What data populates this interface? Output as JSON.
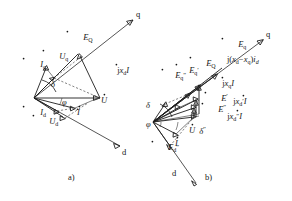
{
  "figure": {
    "type": "phasor-diagram-pair",
    "background_color": "#ffffff",
    "ink_color": "#1a1a1a"
  },
  "panel_a": {
    "caption": "a)",
    "axes": [
      {
        "name": "q-axis",
        "label": "q"
      },
      {
        "name": "d-axis",
        "label": "d"
      }
    ],
    "labels": {
      "eq": "E",
      "eq_sub": "Q",
      "uq": "U",
      "uq_sub": "q",
      "iq": "I",
      "iq_sub": "q",
      "id": "I",
      "id_sub": "d",
      "ud": "U",
      "ud_sub": "d",
      "u": "U",
      "i": "I",
      "jxdi_j": "j",
      "jxdi_x": "x",
      "jxdi_sub": "d",
      "jxdi_i": "I",
      "delta": "δ",
      "phi": "φ"
    }
  },
  "panel_b": {
    "caption": "b)",
    "axes": [
      {
        "name": "q-axis",
        "label": "q"
      },
      {
        "name": "d-axis",
        "label": "d"
      }
    ],
    "labels": {
      "eq_main": "E",
      "eq_main_sub": "Q",
      "eq_bar": "E",
      "eq_bar_sub": "q",
      "eq_prime": "E",
      "eq_prime_sub": "q",
      "eq_prime_mark": "′",
      "eq_dprime": "E",
      "eq_dprime_sub": "q",
      "eq_dprime_mark": "″",
      "ed_dprime": "E",
      "ed_dprime_sub": "d",
      "ed_dprime_mark": "″",
      "e_prime": "E",
      "e_prime_mark": "′",
      "e_dprime": "E",
      "e_dprime_mark": "″",
      "u": "U",
      "i": "I",
      "jxqi_j": "j",
      "jxqi_x": "x",
      "jxqi_sub": "q",
      "jxqi_i": "I",
      "jxdpi_j": "j",
      "jxdpi_x": "x",
      "jxdpi_sub": "d",
      "jxdpi_mark": "′",
      "jxdpi_i": "I",
      "jxddi_j": "j",
      "jxddi_x": "x",
      "jxddi_sub": "d",
      "jxddi_mark": "″",
      "jxddi_i": "I",
      "annotation": "j(xₓ−xₓ)iₓ",
      "annotation_j": "j(",
      "annotation_x1": "x",
      "annotation_sub1": "d",
      "annotation_minus": "−",
      "annotation_x2": "x",
      "annotation_sub2": "q",
      "annotation_close": ")",
      "annotation_i": "i",
      "annotation_sub3": "d",
      "delta": "δ",
      "delta_dprime": "δ",
      "delta_dprime_mark": "″",
      "phi": "φ"
    }
  }
}
